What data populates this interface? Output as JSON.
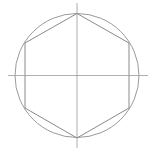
{
  "diagram": {
    "type": "geometric-construction",
    "colors": {
      "background": "#ffffff",
      "circle_stroke": "#9a9a9a",
      "hexagon_stroke": "#8a8a8a",
      "axis_stroke": "#9a9a9a"
    },
    "circle": {
      "cx": 77,
      "cy": 75.5,
      "r": 62
    },
    "hexagon": {
      "vertices": [
        [
          77,
          13.5
        ],
        [
          129,
          43
        ],
        [
          129,
          108
        ],
        [
          77,
          138
        ],
        [
          25,
          108
        ],
        [
          25,
          43
        ]
      ]
    },
    "axes": {
      "horizontal": {
        "x1": 8,
        "y1": 75.5,
        "x2": 148,
        "y2": 75.5
      },
      "vertical": {
        "x1": 77,
        "y1": 3,
        "x2": 77,
        "y2": 148
      }
    }
  }
}
